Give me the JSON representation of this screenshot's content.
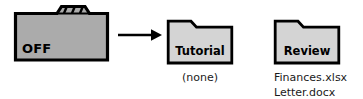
{
  "diagram": {
    "colors": {
      "folder_fill_source": "#ABABAB",
      "folder_fill_target": "#D4D4D4",
      "outline": "#000000",
      "text": "#000000",
      "background": "#FFFFFF"
    },
    "source": {
      "label": "OFF",
      "icon": "folder-with-dividers-icon",
      "tab_divider_count": 3
    },
    "arrow": {
      "icon": "right-arrow-icon",
      "direction": "right"
    },
    "targets": [
      {
        "id": "tutorial",
        "label": "Tutorial",
        "icon": "folder-icon",
        "contents_empty_label": "(none)",
        "contents": []
      },
      {
        "id": "review",
        "label": "Review",
        "icon": "folder-icon",
        "contents_empty_label": "",
        "contents": [
          "Finances.xlsx",
          "Letter.docx"
        ]
      }
    ]
  }
}
